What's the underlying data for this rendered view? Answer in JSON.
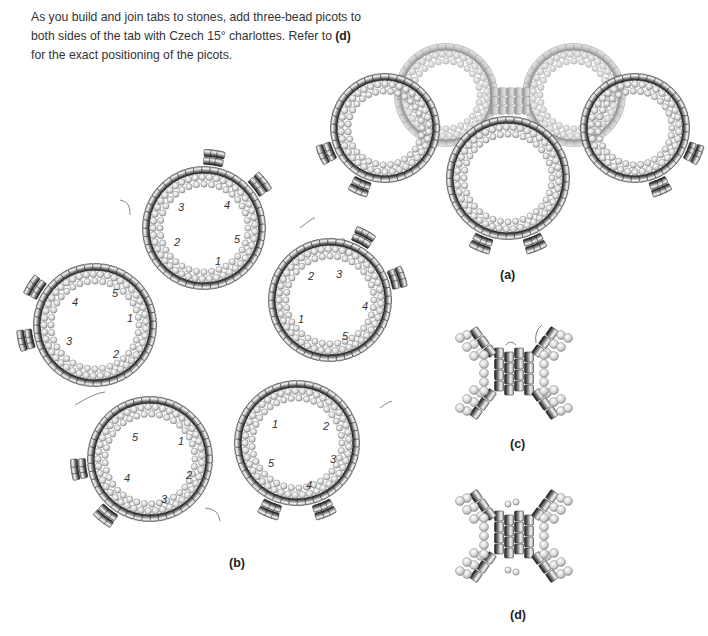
{
  "instructions": {
    "text_before": "As you build and join tabs to stones, add three-bead picots to both sides of the tab with Czech 15° charlottes. Refer to ",
    "bold_ref": "(d)",
    "text_after": " for the exact positioning of the picots."
  },
  "figures": {
    "a": {
      "label": "(a)",
      "label_pos": [
        500,
        268
      ],
      "faded_rings": [
        {
          "cx": 446,
          "cy": 95,
          "r": 52
        },
        {
          "cx": 574,
          "cy": 95,
          "r": 52
        }
      ],
      "rings": [
        {
          "cx": 385,
          "cy": 128,
          "r": 55,
          "tab_angle": 135
        },
        {
          "cx": 635,
          "cy": 128,
          "r": 55,
          "tab_angle": 45
        },
        {
          "cx": 508,
          "cy": 178,
          "r": 62,
          "tab_angle": 90
        }
      ]
    },
    "b": {
      "label": "(b)",
      "label_pos": [
        229,
        556
      ],
      "rings": [
        {
          "cx": 204,
          "cy": 228,
          "r": 62,
          "tab_angle": -60,
          "numbers": [
            {
              "n": "1",
              "x": 215,
              "y": 265
            },
            {
              "n": "2",
              "x": 174,
              "y": 246
            },
            {
              "n": "3",
              "x": 178,
              "y": 211
            },
            {
              "n": "4",
              "x": 224,
              "y": 209
            },
            {
              "n": "5",
              "x": 234,
              "y": 243
            }
          ]
        },
        {
          "cx": 330,
          "cy": 300,
          "r": 62,
          "tab_angle": -40,
          "numbers": [
            {
              "n": "1",
              "x": 298,
              "y": 323
            },
            {
              "n": "2",
              "x": 308,
              "y": 280
            },
            {
              "n": "3",
              "x": 336,
              "y": 278
            },
            {
              "n": "4",
              "x": 362,
              "y": 310
            },
            {
              "n": "5",
              "x": 342,
              "y": 340
            }
          ]
        },
        {
          "cx": 297,
          "cy": 443,
          "r": 63,
          "tab_angle": 90,
          "numbers": [
            {
              "n": "1",
              "x": 272,
              "y": 428
            },
            {
              "n": "2",
              "x": 323,
              "y": 430
            },
            {
              "n": "3",
              "x": 330,
              "y": 463
            },
            {
              "n": "4",
              "x": 306,
              "y": 489
            },
            {
              "n": "5",
              "x": 268,
              "y": 467
            }
          ]
        },
        {
          "cx": 150,
          "cy": 459,
          "r": 63,
          "tab_angle": 150,
          "numbers": [
            {
              "n": "1",
              "x": 178,
              "y": 445
            },
            {
              "n": "2",
              "x": 186,
              "y": 479
            },
            {
              "n": "3",
              "x": 161,
              "y": 503
            },
            {
              "n": "4",
              "x": 124,
              "y": 482
            },
            {
              "n": "5",
              "x": 132,
              "y": 441
            }
          ]
        },
        {
          "cx": 95,
          "cy": 325,
          "r": 62,
          "tab_angle": 190,
          "numbers": [
            {
              "n": "1",
              "x": 127,
              "y": 322
            },
            {
              "n": "2",
              "x": 113,
              "y": 358
            },
            {
              "n": "3",
              "x": 66,
              "y": 345
            },
            {
              "n": "4",
              "x": 72,
              "y": 306
            },
            {
              "n": "5",
              "x": 112,
              "y": 297
            }
          ]
        }
      ]
    },
    "c": {
      "label": "(c)",
      "label_pos": [
        510,
        437
      ],
      "center": [
        514,
        373
      ],
      "picots": false
    },
    "d": {
      "label": "(d)",
      "label_pos": [
        510,
        608
      ],
      "center": [
        514,
        536
      ],
      "picots": true
    }
  },
  "colors": {
    "cylinder_dark": "#1a1a1a",
    "cylinder_mid": "#8a8a8a",
    "cylinder_light": "#f2f2f2",
    "round_bead": "#d6d6d6",
    "round_bead_edge": "#8f8f8f",
    "thread": "#555555",
    "faded": "#b8b8b8"
  }
}
